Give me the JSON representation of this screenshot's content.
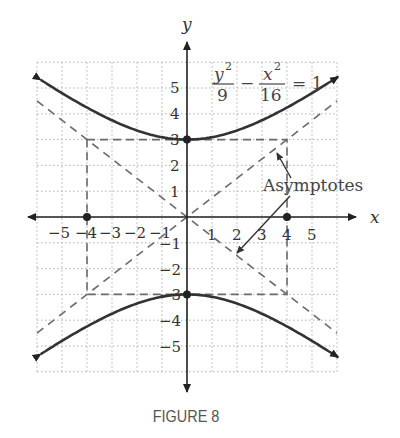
{
  "figure": {
    "caption": "FIGURE 8",
    "equation": {
      "term1_num": "y",
      "term1_exp": "2",
      "term1_den": "9",
      "minus": "−",
      "term2_num": "x",
      "term2_exp": "2",
      "term2_den": "16",
      "equals": "= 1"
    },
    "annotation": "Asymptotes",
    "x_axis_label": "x",
    "y_axis_label": "y",
    "x_ticks": [
      "−5",
      "−4",
      "−3",
      "−2",
      "−1",
      "1",
      "2",
      "3",
      "4",
      "5"
    ],
    "y_ticks": [
      "5",
      "4",
      "3",
      "2",
      "1",
      "−1",
      "−2",
      "−3",
      "−4",
      "−5"
    ]
  },
  "colors": {
    "curve": "#333333",
    "asymptote": "#6a6a6a",
    "grid": "#b0b0b0",
    "axis": "#222222"
  },
  "chart_data": {
    "type": "line",
    "xlabel": "x",
    "ylabel": "y",
    "xlim": [
      -6,
      6
    ],
    "ylim": [
      -6,
      6
    ],
    "grid": true,
    "series": [
      {
        "name": "upper branch",
        "equation": "y = 3*sqrt(1 + x^2/16)",
        "x": [
          -6,
          -4,
          -2,
          0,
          2,
          4,
          6
        ],
        "y": [
          5.41,
          4.24,
          3.35,
          3,
          3.35,
          4.24,
          5.41
        ]
      },
      {
        "name": "lower branch",
        "equation": "y = -3*sqrt(1 + x^2/16)",
        "x": [
          -6,
          -4,
          -2,
          0,
          2,
          4,
          6
        ],
        "y": [
          -5.41,
          -4.24,
          -3.35,
          -3,
          -3.35,
          -4.24,
          -5.41
        ]
      },
      {
        "name": "asymptote 1",
        "style": "dashed",
        "equation": "y = 3x/4"
      },
      {
        "name": "asymptote 2",
        "style": "dashed",
        "equation": "y = -3x/4"
      },
      {
        "name": "fundamental rectangle",
        "style": "dashed",
        "corners": [
          [
            -4,
            3
          ],
          [
            4,
            3
          ],
          [
            4,
            -3
          ],
          [
            -4,
            -3
          ]
        ]
      }
    ],
    "points": [
      {
        "label": "vertex",
        "x": 0,
        "y": 3
      },
      {
        "label": "vertex",
        "x": 0,
        "y": -3
      },
      {
        "label": "focus-related point",
        "x": -4,
        "y": 0
      },
      {
        "label": "focus-related point",
        "x": 4,
        "y": 0
      }
    ],
    "annotations": [
      "Asymptotes"
    ]
  }
}
